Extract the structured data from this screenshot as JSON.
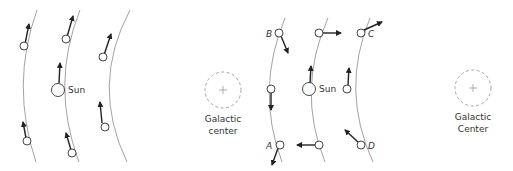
{
  "left_panel": {
    "sun_label": "Sun",
    "center_label_line1": "Galactic",
    "center_label_line2": "center"
  },
  "right_panel": {
    "sun_label": "Sun",
    "center_label_line1": "Galactic",
    "center_label_line2": "Center",
    "points": {
      "a": "A",
      "b": "B",
      "c": "C",
      "d": "D"
    }
  },
  "colors": {
    "orbit": "#8a8a8a",
    "vector": "#222222",
    "galactic_center": "#999999"
  }
}
